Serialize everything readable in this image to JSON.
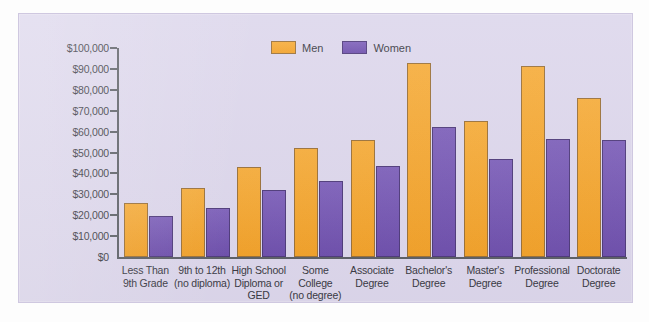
{
  "chart_data": {
    "type": "bar",
    "title": "",
    "xlabel": "",
    "ylabel": "",
    "ylim": [
      0,
      100000
    ],
    "ytick_labels": [
      "$100,000",
      "$90,000",
      "$80,000",
      "$70,000",
      "$60,000",
      "$50,000",
      "$40,000",
      "$30,000",
      "$20,000",
      "$10,000",
      "$0"
    ],
    "ytick_values": [
      100000,
      90000,
      80000,
      70000,
      60000,
      50000,
      40000,
      30000,
      20000,
      10000,
      0
    ],
    "grid": false,
    "legend_position": "top-center",
    "categories": [
      "Less Than 9th Grade",
      "9th to 12th (no diploma)",
      "High School Diploma or GED",
      "Some College (no degree)",
      "Associate Degree",
      "Bachelor's Degree",
      "Master's Degree",
      "Professional Degree",
      "Doctorate Degree"
    ],
    "category_lines": [
      [
        "Less Than",
        "9th Grade"
      ],
      [
        "9th to 12th",
        "(no diploma)"
      ],
      [
        "High School",
        "Diploma or",
        "GED"
      ],
      [
        "Some",
        "College",
        "(no degree)"
      ],
      [
        "Associate",
        "Degree"
      ],
      [
        "Bachelor's",
        "Degree"
      ],
      [
        "Master's",
        "Degree"
      ],
      [
        "Professional",
        "Degree"
      ],
      [
        "Doctorate",
        "Degree"
      ]
    ],
    "series": [
      {
        "name": "Men",
        "color": "#f2a129",
        "values": [
          26000,
          33000,
          43000,
          52000,
          56000,
          93000,
          65000,
          91500,
          76000
        ]
      },
      {
        "name": "Women",
        "color": "#6e4fac",
        "values": [
          19500,
          23500,
          32000,
          36500,
          43500,
          62000,
          47000,
          56500,
          56000
        ]
      }
    ]
  },
  "legend": {
    "items": [
      {
        "label": "Men",
        "color": "#f2a129"
      },
      {
        "label": "Women",
        "color": "#6e4fac"
      }
    ]
  },
  "colors": {
    "panel_background": "#ddd7ec",
    "page_background": "#ffffff",
    "axis": "#5c5f66",
    "text": "#3a3a44",
    "men": "#f2a129",
    "women": "#6e4fac"
  }
}
